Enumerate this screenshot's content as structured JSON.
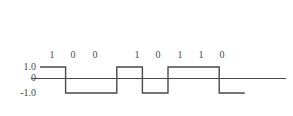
{
  "figure": {
    "background_color": "#ffffff",
    "line_color": "#4a4a4a"
  },
  "axis": {
    "labels": [
      {
        "text": "1.0",
        "level": 1
      },
      {
        "text": "0",
        "level": 0
      },
      {
        "text": "-1.0",
        "level": -1
      }
    ]
  },
  "bits": [
    {
      "label": "1"
    },
    {
      "label": "0"
    },
    {
      "label": "0"
    },
    {
      "label": "1"
    },
    {
      "label": "0"
    },
    {
      "label": "1"
    },
    {
      "label": "1"
    },
    {
      "label": "0"
    }
  ],
  "chart_data": {
    "type": "line",
    "xlabel": "",
    "ylabel": "",
    "ylim": [
      -1.0,
      1.0
    ],
    "yticks": [
      1.0,
      0,
      -1.0
    ],
    "ytick_labels": [
      "1.0",
      "0",
      "-1.0"
    ],
    "grid": false,
    "legend": null,
    "encoding": "NRZ-L",
    "categories": [
      "1",
      "0",
      "0",
      "1",
      "0",
      "1",
      "1",
      "0"
    ],
    "values": [
      1.0,
      -1.0,
      -1.0,
      1.0,
      -1.0,
      1.0,
      1.0,
      -1.0
    ],
    "series": [
      {
        "name": "signal",
        "values": [
          1.0,
          -1.0,
          -1.0,
          1.0,
          -1.0,
          1.0,
          1.0,
          -1.0
        ]
      }
    ],
    "annotations": [
      "zero reference line spans full plot width"
    ]
  }
}
